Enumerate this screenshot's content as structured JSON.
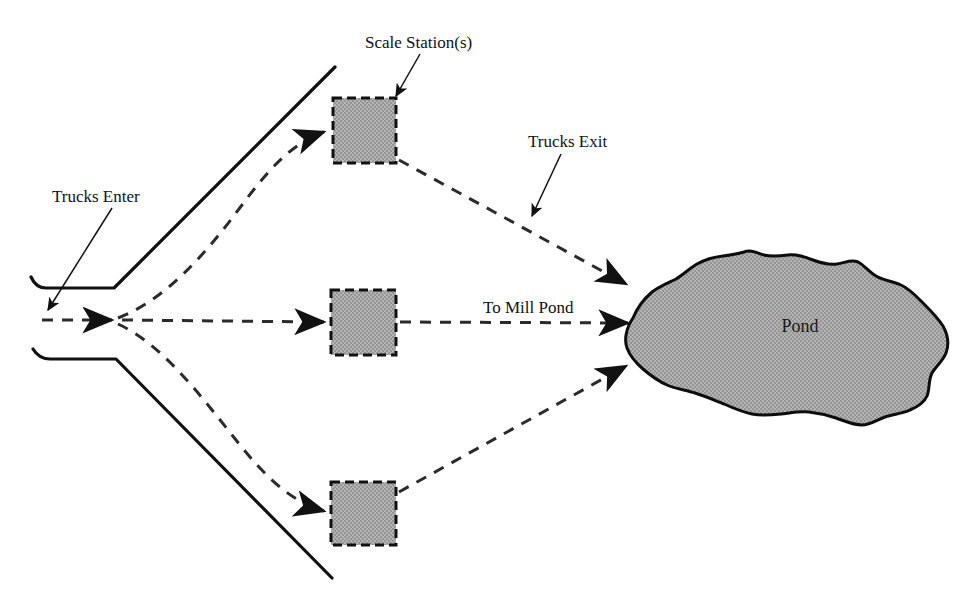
{
  "diagram": {
    "colors": {
      "fill_gray": "#a8a8a8",
      "outline": "#111111",
      "background": "#ffffff",
      "path_stroke": "#2b2b2b"
    },
    "labels": {
      "trucks_enter": "Trucks Enter",
      "scale_stations": "Scale Station(s)",
      "trucks_exit": "Trucks Exit",
      "to_mill_pond": "To Mill Pond",
      "pond": "Pond"
    },
    "stations": [
      {
        "name": "scale-station-top",
        "x": 333,
        "y": 98,
        "width": 63,
        "height": 65
      },
      {
        "name": "scale-station-middle",
        "x": 331,
        "y": 290,
        "width": 65,
        "height": 65
      },
      {
        "name": "scale-station-bottom",
        "x": 331,
        "y": 482,
        "width": 65,
        "height": 63
      }
    ],
    "pond": {
      "name": "mill-pond",
      "label_x": 800,
      "label_y": 328
    },
    "roads": [
      {
        "name": "upper-road-edge"
      },
      {
        "name": "lower-road-edge"
      }
    ],
    "routes": [
      {
        "name": "route-entry-fork"
      },
      {
        "name": "route-top-station-in"
      },
      {
        "name": "route-top-station-out"
      },
      {
        "name": "route-middle-station-in"
      },
      {
        "name": "route-middle-station-out"
      },
      {
        "name": "route-bottom-station-in"
      },
      {
        "name": "route-bottom-station-out"
      }
    ]
  }
}
